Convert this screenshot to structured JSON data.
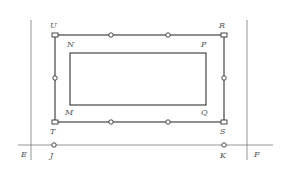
{
  "diagram": {
    "colors": {
      "line": "#333333",
      "guide": "#7a7a7a",
      "label": "#555555",
      "background": "#ffffff"
    },
    "guide_lines": {
      "left_vertical": {
        "x": 31,
        "y1": 20,
        "y2": 160
      },
      "right_vertical": {
        "x": 247,
        "y1": 20,
        "y2": 160
      },
      "horizontal_EF": {
        "y": 145,
        "x1": 18,
        "x2": 273
      }
    },
    "outer_rect": {
      "corners": {
        "U": {
          "x": 55,
          "y": 35,
          "label": "U"
        },
        "R": {
          "x": 224,
          "y": 35,
          "label": "R"
        },
        "T": {
          "x": 55,
          "y": 122,
          "label": "T"
        },
        "S": {
          "x": 224,
          "y": 122,
          "label": "S"
        }
      },
      "corner_marker": "square",
      "edge_nodes": [
        {
          "x": 111,
          "y": 35
        },
        {
          "x": 168,
          "y": 35
        },
        {
          "x": 111,
          "y": 122
        },
        {
          "x": 168,
          "y": 122
        },
        {
          "x": 55,
          "y": 78
        },
        {
          "x": 224,
          "y": 78
        }
      ]
    },
    "inner_rect": {
      "corners": {
        "N": {
          "x": 70,
          "y": 53,
          "label": "N"
        },
        "P": {
          "x": 206,
          "y": 53,
          "label": "P"
        },
        "M": {
          "x": 70,
          "y": 105,
          "label": "M"
        },
        "Q": {
          "x": 206,
          "y": 105,
          "label": "Q"
        }
      }
    },
    "line_points": {
      "E": {
        "label": "E"
      },
      "F": {
        "label": "F"
      },
      "J": {
        "x": 54,
        "y": 145,
        "label": "J"
      },
      "K": {
        "x": 224,
        "y": 145,
        "label": "K"
      }
    }
  }
}
